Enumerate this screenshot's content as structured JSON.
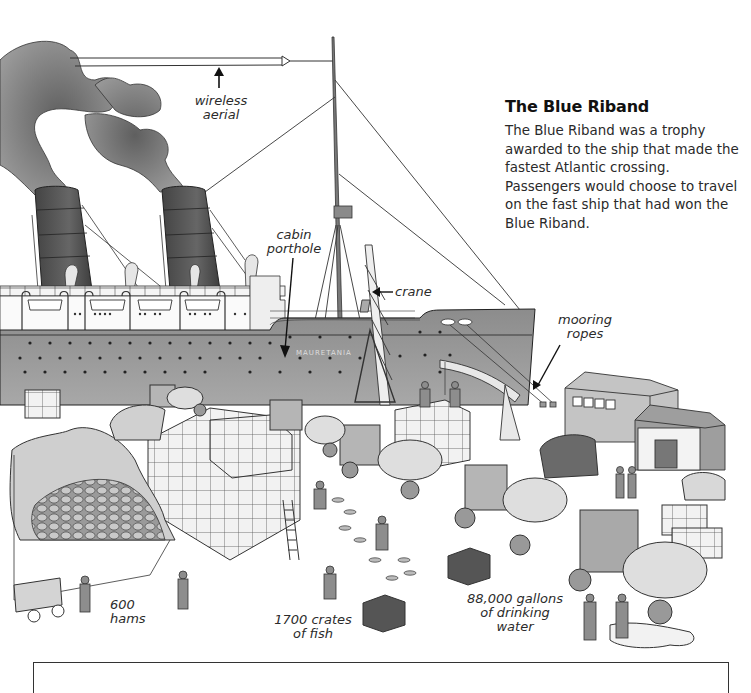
{
  "sidebar": {
    "title": "The Blue Riband",
    "body": "The Blue Riband was a trophy awarded to the ship that made the fastest Atlantic crossing. Passengers would choose to travel on the fast ship that had won the Blue Riband."
  },
  "labels": {
    "wireless_aerial": [
      "wireless",
      "aerial"
    ],
    "cabin_porthole": [
      "cabin",
      "porthole"
    ],
    "crane": "crane",
    "mooring_ropes": [
      "mooring",
      "ropes"
    ],
    "hams": [
      "600",
      "hams"
    ],
    "fish": [
      "1700 crates",
      "of fish"
    ],
    "water": [
      "88,000 gallons",
      "of drinking",
      "water"
    ]
  },
  "ship": {
    "name": "MAURETANIA"
  },
  "colors": {
    "hull": "#8a8a8a",
    "funnel": "#5a5a5a",
    "smoke": "#7a7a7a",
    "ink": "#2b2b2b"
  }
}
